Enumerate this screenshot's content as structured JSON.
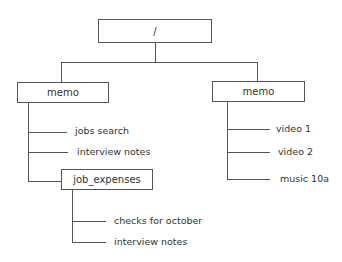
{
  "diagram": {
    "type": "directory-tree",
    "root": {
      "label": "/"
    },
    "left_folder": {
      "label": "memo",
      "children": [
        {
          "label": "jobs search"
        },
        {
          "label": "interview notes"
        }
      ],
      "subfolder": {
        "label": "job_expenses",
        "children": [
          {
            "label": "checks for october"
          },
          {
            "label": "interview notes"
          }
        ]
      }
    },
    "right_folder": {
      "label": "memo",
      "children": [
        {
          "label": "video 1"
        },
        {
          "label": "video 2"
        },
        {
          "label": "music 10a"
        }
      ]
    }
  }
}
